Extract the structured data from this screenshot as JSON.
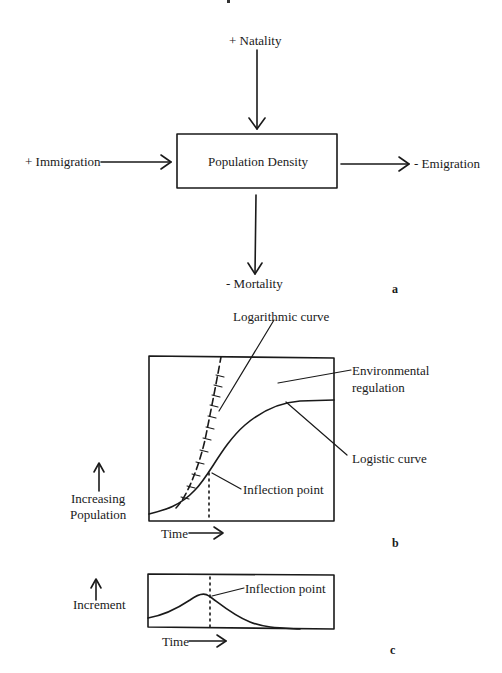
{
  "figure": {
    "top_mark": ".",
    "panel_a": {
      "tag": "a",
      "box_label": "Population Density",
      "inputs": {
        "natality": "+ Natality",
        "immigration": "+ Immigration"
      },
      "outputs": {
        "emigration": "- Emigration",
        "mortality": "- Mortality"
      }
    },
    "panel_b": {
      "tag": "b",
      "logarithmic_label": "Logarithmic curve",
      "environmental_label_line1": "Environmental",
      "environmental_label_line2": "regulation",
      "logistic_label": "Logistic curve",
      "inflection_label": "Inflection point",
      "y_label_line1": "Increasing",
      "y_label_line2": "Population",
      "x_label": "Time"
    },
    "panel_c": {
      "tag": "c",
      "inflection_label": "Inflection point",
      "y_label": "Increment",
      "x_label": "Time"
    }
  }
}
